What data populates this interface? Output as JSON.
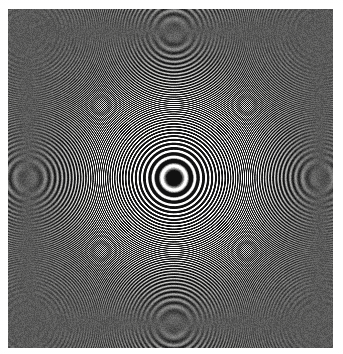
{
  "figure": {
    "kind": "interference-fringe-photograph",
    "width": 343,
    "height": 354,
    "background_color": "#ffffff"
  },
  "chart_data": {
    "type": "heatmap",
    "xlabel": "",
    "ylabel": "",
    "legend": [],
    "annotations": [],
    "grid": false,
    "pattern": {
      "model": "fresnel-zone-plate",
      "description": "Concentric circular fringes, dark central spot, radial period decreasing as 1/r",
      "center_x": 174,
      "center_y": 178,
      "plate_left": 8,
      "plate_top": 9,
      "plate_right": 333,
      "plate_bottom": 348,
      "plate_width": 325,
      "plate_height": 339,
      "center_spot_radius": 18,
      "center_spot_is_dark": true,
      "phase_offset_rad": 3.14159,
      "scale_constant_k": 0.0215,
      "aspect_ratio_x_over_y": 1.0,
      "fringe_count_to_corner": 48,
      "outer_fringe_period_px": 4.6,
      "ink_color": "#1d1d1d",
      "paper_color": "#f7f7f5",
      "contrast_gamma": 1.35,
      "grain_amplitude": 0.12,
      "blur_px": 0.7
    },
    "radial_profile": {
      "x": [
        0,
        8,
        18,
        26,
        34,
        42,
        52,
        60,
        68,
        76,
        84,
        92,
        100,
        110,
        120,
        130,
        140,
        152,
        164,
        176,
        188,
        200,
        212,
        224,
        236
      ],
      "y": [
        0.05,
        0.07,
        0.25,
        0.85,
        0.95,
        0.45,
        0.08,
        0.4,
        0.92,
        0.6,
        0.1,
        0.55,
        0.95,
        0.2,
        0.9,
        0.25,
        0.88,
        0.3,
        0.85,
        0.32,
        0.82,
        0.35,
        0.8,
        0.36,
        0.78
      ],
      "xlabel": "radius from center (px)",
      "ylabel": "normalized brightness",
      "xlim": [
        0,
        240
      ],
      "ylim": [
        0,
        1
      ]
    },
    "dark_ring_radii_px": [
      0,
      48,
      78,
      100,
      119,
      136,
      151,
      165,
      178,
      190,
      202,
      213,
      224,
      234,
      244,
      253,
      262,
      271,
      280,
      288,
      296,
      304,
      312,
      320,
      327,
      335,
      342,
      349,
      356,
      363,
      370,
      377,
      383,
      390,
      396,
      402,
      408,
      414,
      420,
      426,
      432,
      437,
      443,
      448,
      454,
      459,
      465,
      470
    ],
    "bright_ring_radii_px": [
      30,
      66,
      90,
      110,
      128,
      144,
      158,
      172,
      184,
      196,
      208,
      219,
      229,
      239,
      249,
      258,
      267,
      276,
      284,
      292,
      300,
      308,
      316,
      323,
      331,
      338,
      345,
      352,
      359,
      366,
      373,
      380,
      386,
      393,
      399,
      405,
      411,
      417,
      423,
      429,
      435,
      440,
      446,
      451,
      457,
      462,
      468
    ]
  }
}
